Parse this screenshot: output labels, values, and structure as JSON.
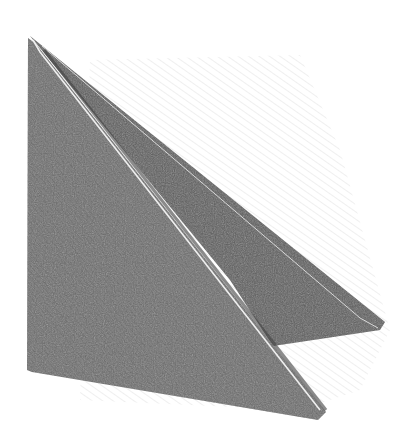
{
  "image": {
    "subject": "Pencil sketch of a folded paper triangle",
    "colors": {
      "background": "#ffffff",
      "front_flap": "#6e6e6e",
      "back_flap": "#5f5f5f",
      "crease_highlight": "#e8e8e8",
      "hatching": "#c8c8c8"
    }
  }
}
